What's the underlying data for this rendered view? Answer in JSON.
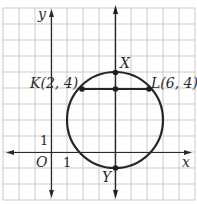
{
  "figure": {
    "type": "coordinate-geometry",
    "grid": {
      "unit_px": 16,
      "origin_px": [
        51,
        152
      ],
      "x_range": [
        -3,
        9
      ],
      "y_range": [
        -3,
        9
      ]
    },
    "axes": {
      "x_label": "x",
      "y_label": "y",
      "origin_label": "O",
      "x_tick_label": "1",
      "y_tick_label": "1"
    },
    "circle": {
      "center": [
        4,
        2
      ],
      "radius": 3
    },
    "points": [
      {
        "name": "K",
        "label": "K(2, 4)",
        "coords": [
          2,
          4
        ]
      },
      {
        "name": "L",
        "label": "L(6, 4)",
        "coords": [
          6,
          4
        ]
      },
      {
        "name": "X",
        "label": "X",
        "coords": [
          4,
          5
        ]
      },
      {
        "name": "Y",
        "label": "Y",
        "coords": [
          4,
          -1
        ]
      },
      {
        "name": "M",
        "label": "",
        "coords": [
          4,
          4
        ]
      }
    ],
    "segments": [
      {
        "from": "K",
        "to": "L",
        "description": "chord KL"
      }
    ],
    "lines": [
      {
        "description": "vertical line through X and Y",
        "x": 4
      }
    ],
    "colors": {
      "grid": "#c9c9c9",
      "ink": "#262626",
      "background": "#ffffff"
    }
  },
  "labels": {
    "y_axis": "y",
    "x_axis": "x",
    "origin": "O",
    "x_one": "1",
    "y_one": "1",
    "point_k": "K(2, 4)",
    "point_l": "L(6, 4)",
    "point_x": "X",
    "point_y": "Y"
  }
}
